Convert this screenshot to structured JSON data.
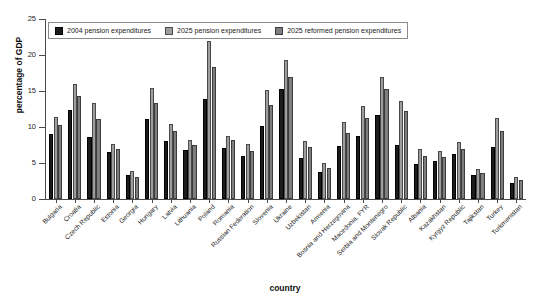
{
  "chart_data": {
    "type": "bar",
    "title": "",
    "xlabel": "country",
    "ylabel": "percentage of GDP",
    "ylim": [
      0,
      25
    ],
    "yticks": [
      0,
      5,
      10,
      15,
      20,
      25
    ],
    "grid": false,
    "legend_position": "top-left inside plot",
    "legend": [
      "2004 pension expenditures",
      "2025 pension expenditures",
      "2025 reformed pension expenditures"
    ],
    "colors": {
      "series_2004": "#1c1c1c",
      "series_2025": "#9d9d9d",
      "series_2025_reformed": "#7e7e7e",
      "axis": "#4a4a4a",
      "background": "#ffffff"
    },
    "categories": [
      "Bulgaria",
      "Croatia",
      "Czech Republic",
      "Estonia",
      "Georgia",
      "Hungary",
      "Latvia",
      "Lithuania",
      "Poland",
      "Romania",
      "Russian Federation",
      "Slovenia",
      "Ukraine",
      "Uzbekistan",
      "Armenia",
      "Bosnia and Herzegovina",
      "Macedonia, FYR",
      "Serbia and Montenegro",
      "Slovak Republic",
      "Albania",
      "Kazakhstan",
      "Kyrgyz Republic",
      "Tajikstan",
      "Turkey",
      "Turkmenistan"
    ],
    "series": [
      {
        "name": "2004 pension expenditures",
        "color": "#1c1c1c",
        "values": [
          9.0,
          12.3,
          8.6,
          6.5,
          3.3,
          11.1,
          8.1,
          6.8,
          13.9,
          7.1,
          6.0,
          10.1,
          15.3,
          5.7,
          3.7,
          7.4,
          8.7,
          11.6,
          7.5,
          4.8,
          5.3,
          6.2,
          3.3,
          7.2,
          2.2
        ]
      },
      {
        "name": "2025 pension expenditures",
        "color": "#9d9d9d",
        "values": [
          11.4,
          16.0,
          13.4,
          7.6,
          3.9,
          15.4,
          10.4,
          8.2,
          22.0,
          8.8,
          7.6,
          15.2,
          19.3,
          8.0,
          5.0,
          10.7,
          12.9,
          16.9,
          13.6,
          6.9,
          6.6,
          7.9,
          4.2,
          11.2,
          3.0
        ]
      },
      {
        "name": "2025 reformed pension expenditures",
        "color": "#7e7e7e",
        "values": [
          10.3,
          14.3,
          11.1,
          7.0,
          3.0,
          13.4,
          9.4,
          7.5,
          18.4,
          8.2,
          6.6,
          13.1,
          16.9,
          7.2,
          4.3,
          9.2,
          11.2,
          15.3,
          12.2,
          6.0,
          5.9,
          7.0,
          3.6,
          9.5,
          2.6
        ]
      }
    ]
  }
}
